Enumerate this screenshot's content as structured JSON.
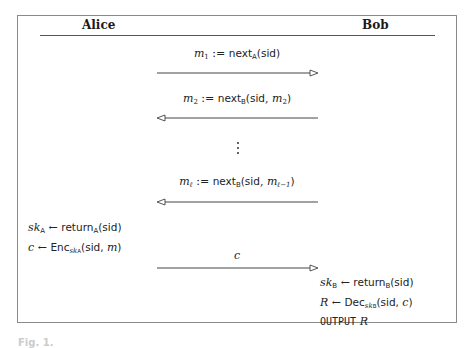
{
  "header": {
    "left_party": "Alice",
    "right_party": "Bob"
  },
  "messages": [
    {
      "dir": "right",
      "var": "m",
      "var_sub": "1",
      "op": ":=",
      "fn": "next",
      "fn_sub": "A",
      "args_sf": "sid",
      "args_math": "",
      "args_math_sub": ""
    },
    {
      "dir": "left",
      "var": "m",
      "var_sub": "2",
      "op": ":=",
      "fn": "next",
      "fn_sub": "B",
      "args_sf": "sid",
      "args_math": "m",
      "args_math_sub": "2"
    },
    {
      "dir": "left",
      "var": "m",
      "var_sub": "ℓ",
      "op": ":=",
      "fn": "next",
      "fn_sub": "B",
      "args_sf": "sid",
      "args_math": "m",
      "args_math_sub": "ℓ−1"
    },
    {
      "dir": "right",
      "label": "c"
    }
  ],
  "ellipsis": "⋮",
  "alice_steps": [
    {
      "lhs": "sk",
      "lhs_sub": "A",
      "arrow": "←",
      "fn": "return",
      "fn_sub": "A",
      "args": "(sid)"
    },
    {
      "lhs": "c",
      "lhs_sub": "",
      "arrow": "←",
      "fn": "Enc",
      "fn_sub": "sk",
      "fn_sub_sub": "A",
      "args_pre": "(sid, ",
      "args_math": "m",
      "args_post": ")"
    }
  ],
  "bob_steps": [
    {
      "lhs": "sk",
      "lhs_sub": "B",
      "arrow": "←",
      "fn": "return",
      "fn_sub": "B",
      "args": "(sid)"
    },
    {
      "lhs": "R",
      "lhs_sub": "",
      "arrow": "←",
      "fn": "Dec",
      "fn_sub": "sk",
      "fn_sub_sub": "B",
      "args_pre": "(sid, ",
      "args_math": "c",
      "args_post": ")"
    },
    {
      "keyword": "OUTPUT",
      "value": "R"
    }
  ],
  "caption": "Fig. 1."
}
